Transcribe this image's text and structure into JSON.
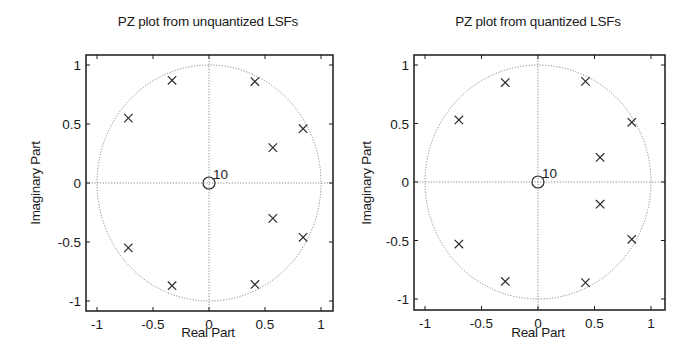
{
  "chart_data": [
    {
      "type": "scatter",
      "title": "PZ plot from unquantized LSFs",
      "xlabel": "Real Part",
      "ylabel": "Imaginary Part",
      "xlim": [
        -1.1,
        1.1
      ],
      "ylim": [
        -1.1,
        1.1
      ],
      "xticks": [
        -1,
        -0.5,
        0,
        0.5,
        1
      ],
      "yticks": [
        -1,
        -0.5,
        0,
        0.5,
        1
      ],
      "xtick_labels": [
        "-1",
        "-0.5",
        "0",
        "0.5",
        "1"
      ],
      "ytick_labels": [
        "-1",
        "-0.5",
        "0",
        "0.5",
        "1"
      ],
      "grid": "axes lines at x=0 and y=0 (dotted)",
      "unit_circle": true,
      "series": [
        {
          "name": "poles",
          "marker": "x",
          "points": [
            {
              "x": -0.72,
              "y": 0.55
            },
            {
              "x": -0.72,
              "y": -0.55
            },
            {
              "x": -0.33,
              "y": 0.87
            },
            {
              "x": -0.33,
              "y": -0.87
            },
            {
              "x": 0.41,
              "y": 0.86
            },
            {
              "x": 0.41,
              "y": -0.86
            },
            {
              "x": 0.57,
              "y": 0.3
            },
            {
              "x": 0.57,
              "y": -0.3
            },
            {
              "x": 0.84,
              "y": 0.46
            },
            {
              "x": 0.84,
              "y": -0.46
            }
          ]
        },
        {
          "name": "zeros",
          "marker": "o",
          "points": [
            {
              "x": 0,
              "y": 0
            }
          ],
          "multiplicity_label": "10"
        }
      ]
    },
    {
      "type": "scatter",
      "title": "PZ plot from quantized LSFs",
      "xlabel": "Real Part",
      "ylabel": "Imaginary Part",
      "xlim": [
        -1.1,
        1.1
      ],
      "ylim": [
        -1.1,
        1.1
      ],
      "xticks": [
        -1,
        -0.5,
        0,
        0.5,
        1
      ],
      "yticks": [
        -1,
        -0.5,
        0,
        0.5,
        1
      ],
      "xtick_labels": [
        "-1",
        "-0.5",
        "0",
        "0.5",
        "1"
      ],
      "ytick_labels": [
        "-1",
        "-0.5",
        "0",
        "0.5",
        "1"
      ],
      "grid": "axes lines at x=0 and y=0 (dotted)",
      "unit_circle": true,
      "series": [
        {
          "name": "poles",
          "marker": "x",
          "points": [
            {
              "x": -0.7,
              "y": 0.53
            },
            {
              "x": -0.7,
              "y": -0.53
            },
            {
              "x": -0.29,
              "y": 0.85
            },
            {
              "x": -0.29,
              "y": -0.85
            },
            {
              "x": 0.42,
              "y": 0.86
            },
            {
              "x": 0.42,
              "y": -0.86
            },
            {
              "x": 0.55,
              "y": 0.21
            },
            {
              "x": 0.55,
              "y": -0.19
            },
            {
              "x": 0.83,
              "y": 0.51
            },
            {
              "x": 0.83,
              "y": -0.49
            }
          ]
        },
        {
          "name": "zeros",
          "marker": "o",
          "points": [
            {
              "x": 0,
              "y": 0
            }
          ],
          "multiplicity_label": "10"
        }
      ]
    }
  ],
  "colors": {
    "axes": "#1a1a1a",
    "marker": "#2a2a2a",
    "dotted": "#8a8a8a",
    "background": "#ffffff"
  }
}
